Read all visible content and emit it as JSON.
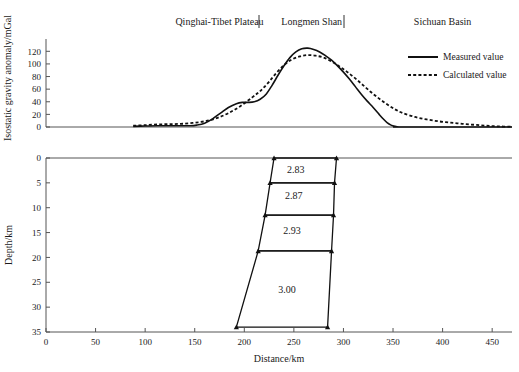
{
  "figure": {
    "title": "",
    "width": 519,
    "height": 372
  },
  "chart_data": [
    {
      "type": "line",
      "id": "isostatic-gravity-profile",
      "title": "",
      "xlabel": "",
      "ylabel": "Isostatic gravity anomaly/mGal",
      "xlim": [
        0,
        470
      ],
      "ylim": [
        0,
        130
      ],
      "yticks": [
        0,
        20,
        40,
        60,
        80,
        100,
        120
      ],
      "xticks": [],
      "grid": false,
      "legend_position": "right",
      "annotations": [
        {
          "text": "Qinghai-Tibet Plateau",
          "x": 175,
          "y": 128
        },
        {
          "text": "Longmen Shan",
          "x": 268,
          "y": 128
        },
        {
          "text": "Sichuan Basin",
          "x": 400,
          "y": 128
        }
      ],
      "series": [
        {
          "name": "Measured value",
          "style": "solid",
          "color": "#111111",
          "x": [
            88,
            100,
            112,
            124,
            136,
            145,
            152,
            160,
            168,
            176,
            184,
            192,
            198,
            204,
            210,
            216,
            222,
            228,
            234,
            240,
            246,
            252,
            258,
            264,
            270,
            276,
            282,
            288,
            294,
            300,
            306,
            312,
            318,
            324,
            330,
            336,
            340,
            344,
            348,
            352,
            356,
            360,
            470
          ],
          "y": [
            1,
            1.5,
            2,
            2,
            2,
            2,
            3,
            6,
            13,
            22,
            31,
            37,
            39,
            39,
            40,
            44,
            52,
            66,
            82,
            97,
            110,
            119,
            124,
            125,
            123,
            119,
            113,
            106,
            97,
            87,
            76,
            64,
            52,
            41,
            31,
            20,
            13,
            7,
            3,
            1,
            0,
            0,
            0
          ]
        },
        {
          "name": "Calculated value",
          "style": "dotted",
          "color": "#111111",
          "x": [
            88,
            100,
            112,
            124,
            136,
            148,
            160,
            172,
            184,
            196,
            208,
            216,
            224,
            232,
            240,
            248,
            256,
            264,
            272,
            280,
            288,
            296,
            304,
            312,
            320,
            328,
            336,
            344,
            352,
            360,
            372,
            384,
            396,
            408,
            420,
            432,
            444,
            456,
            470
          ],
          "y": [
            2,
            3,
            4,
            4.5,
            5,
            6.5,
            9,
            14,
            22,
            33,
            47,
            57,
            70,
            85,
            98,
            107,
            112,
            114,
            113,
            110,
            104,
            96,
            87,
            77,
            66,
            55,
            45,
            36,
            28,
            22,
            16,
            12,
            9,
            7,
            5,
            3.5,
            2,
            1,
            0.5
          ]
        }
      ]
    },
    {
      "type": "line",
      "id": "density-model-cross-section",
      "title": "",
      "xlabel": "Distance/km",
      "ylabel": "Depth/km",
      "xlim": [
        0,
        470
      ],
      "ylim": [
        0,
        35
      ],
      "y_inverted": true,
      "xticks": [
        0,
        50,
        100,
        150,
        200,
        250,
        300,
        350,
        400,
        450
      ],
      "yticks": [
        0,
        5,
        10,
        15,
        20,
        25,
        30,
        35
      ],
      "grid": false,
      "bodies": [
        {
          "density": "2.83",
          "label_x": 252,
          "label_y": 2.3,
          "polygon": [
            [
              230,
              0
            ],
            [
              293,
              0
            ],
            [
              291,
              5
            ],
            [
              226,
              5
            ]
          ]
        },
        {
          "density": "2.87",
          "label_x": 250,
          "label_y": 7.6,
          "polygon": [
            [
              226,
              5
            ],
            [
              291,
              5
            ],
            [
              290,
              11.5
            ],
            [
              221,
              11.5
            ]
          ]
        },
        {
          "density": "2.93",
          "label_x": 248,
          "label_y": 14.5,
          "polygon": [
            [
              221,
              11.5
            ],
            [
              290,
              11.5
            ],
            [
              288,
              18.7
            ],
            [
              214,
              18.7
            ]
          ]
        },
        {
          "density": "3.00",
          "label_x": 243,
          "label_y": 26.5,
          "polygon": [
            [
              214,
              18.7
            ],
            [
              288,
              18.7
            ],
            [
              284,
              34
            ],
            [
              192,
              34
            ]
          ]
        }
      ],
      "vertices": [
        [
          230,
          0
        ],
        [
          293,
          0
        ],
        [
          226,
          5
        ],
        [
          291,
          5
        ],
        [
          221,
          11.5
        ],
        [
          290,
          11.5
        ],
        [
          214,
          18.7
        ],
        [
          288,
          18.7
        ],
        [
          192,
          34
        ],
        [
          284,
          34
        ]
      ]
    }
  ],
  "top_panel": {
    "ylabel": "Isostatic gravity anomaly/mGal",
    "ytick_labels": [
      "120",
      "100",
      "80",
      "60",
      "40",
      "20",
      "0"
    ],
    "annotations": {
      "plateau": "Qinghai-Tibet Plateau",
      "longmen_shan": "Longmen Shan",
      "basin": "Sichuan Basin"
    },
    "legend": [
      {
        "label": "Measured value",
        "style": "solid"
      },
      {
        "label": "Calculated value",
        "style": "dotted"
      }
    ]
  },
  "bottom_panel": {
    "ylabel": "Depth/km",
    "xlabel": "Distance/km",
    "ytick_labels": [
      "0",
      "5",
      "10",
      "15",
      "20",
      "25",
      "30",
      "35"
    ],
    "xtick_labels": [
      "0",
      "50",
      "100",
      "150",
      "200",
      "250",
      "300",
      "350",
      "400",
      "450"
    ],
    "density_labels": [
      "2.83",
      "2.87",
      "2.93",
      "3.00"
    ]
  },
  "colors": {
    "ink": "#111111",
    "axis": "#555555",
    "background": "#ffffff"
  }
}
